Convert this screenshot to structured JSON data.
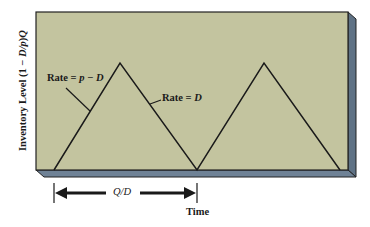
{
  "diagram": {
    "y_axis_label_prefix": "Inventory Level (1 − ",
    "y_axis_label_italic": "D/p",
    "y_axis_label_suffix": ")",
    "y_axis_label_end": "Q",
    "x_axis_label": "Time",
    "cycle_label": "Q/D",
    "production_rate_label_prefix": "Rate = ",
    "production_rate_label_italic": "p − D",
    "demand_rate_label_prefix": "Rate = ",
    "demand_rate_label_italic": "D",
    "colors": {
      "panel_face": "#c3c49f",
      "panel_bevel": "#5f7285",
      "line": "#1a1a1a"
    },
    "sawtooth_points": [
      [
        54,
        170
      ],
      [
        120,
        63
      ],
      [
        197,
        170
      ],
      [
        264,
        63
      ],
      [
        340,
        170
      ]
    ]
  }
}
